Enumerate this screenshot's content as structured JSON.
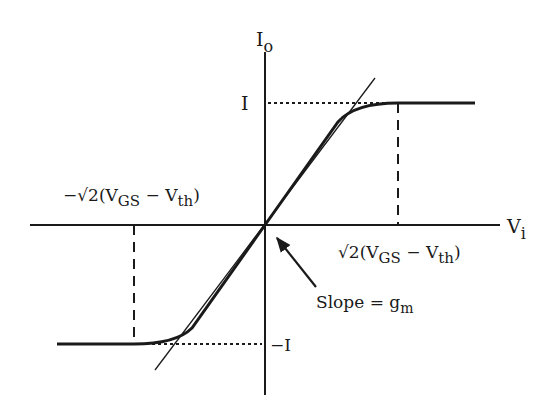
{
  "diagram": {
    "colors": {
      "ink": "#1a1a1a",
      "background": "#ffffff"
    },
    "axes": {
      "y_label": {
        "main": "I",
        "sub": "o"
      },
      "x_label": {
        "main": "V",
        "sub": "i"
      }
    },
    "levels": {
      "positive": "I",
      "negative": "−I"
    },
    "breakpoints": {
      "right": {
        "prefix": "√2(V",
        "sub1": "GS",
        "mid": " − V",
        "sub2": "th",
        "suffix": ")"
      },
      "left": {
        "prefix": "−√2(V",
        "sub1": "GS",
        "mid": " − V",
        "sub2": "th",
        "suffix": ")"
      }
    },
    "annotation": {
      "text": "Slope = g",
      "sub": "m"
    }
  }
}
